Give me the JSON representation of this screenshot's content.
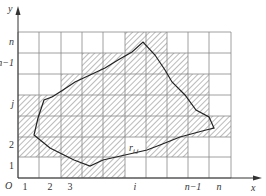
{
  "axes": {
    "x_label": "x",
    "y_label": "y",
    "origin_label": "O"
  },
  "x_ticks": [
    {
      "label": "1",
      "x": 25
    },
    {
      "label": "2",
      "x": 50
    },
    {
      "label": "3",
      "x": 70
    },
    {
      "label": "i",
      "x": 135
    },
    {
      "label": "n−1",
      "x": 193
    },
    {
      "label": "n",
      "x": 219
    }
  ],
  "y_ticks": [
    {
      "label": "n",
      "y": 45
    },
    {
      "label": "n−1",
      "y": 66
    },
    {
      "label": "j",
      "y": 107
    },
    {
      "label": "2",
      "y": 148
    },
    {
      "label": "1",
      "y": 169
    }
  ],
  "cell_label": "r",
  "cell_label_sub": "i,j",
  "grid": {
    "cols": 10,
    "rows": 7,
    "x0": 18,
    "y0": 32,
    "cell_w": 21.3,
    "cell_h": 20.9,
    "hatched_cells": [
      {
        "row": 0,
        "cols": [
          5,
          6
        ]
      },
      {
        "row": 1,
        "cols": [
          3,
          4,
          5,
          6,
          7
        ]
      },
      {
        "row": 2,
        "cols": [
          2,
          3,
          4,
          5,
          6,
          7,
          8
        ]
      },
      {
        "row": 3,
        "cols": [
          0,
          1,
          2,
          3,
          4,
          5,
          6,
          7,
          8
        ]
      },
      {
        "row": 4,
        "cols": [
          0,
          1,
          2,
          3,
          4,
          5,
          6,
          7,
          8,
          9
        ]
      },
      {
        "row": 5,
        "cols": [
          0,
          1,
          2,
          3,
          4,
          6,
          7
        ]
      },
      {
        "row": 6,
        "cols": [
          2,
          3,
          4
        ]
      }
    ]
  },
  "region_outline": "52,97 63,90 75,82 90,75 105,68 118,60 132,52 143,42 155,55 165,70 172,82 185,95 196,110 209,117 214,128 206,130 180,137 160,145 147,150 125,155 103,160 90,166 74,160 50,148 34,135 38,118 44,100 52,97",
  "caption": "…"
}
